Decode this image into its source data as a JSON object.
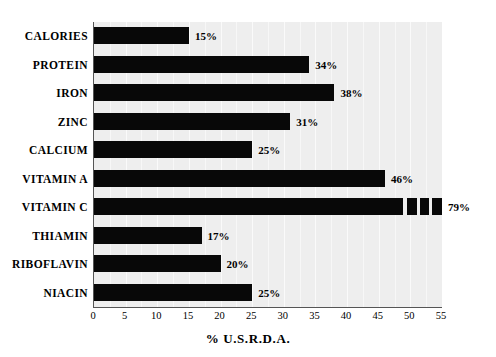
{
  "chart_data": {
    "type": "bar",
    "orientation": "horizontal",
    "title": "",
    "xlabel": "% U.S.R.D.A.",
    "ylabel": "",
    "xlim": [
      0,
      55
    ],
    "xticks": [
      0,
      5,
      10,
      15,
      20,
      25,
      30,
      35,
      40,
      45,
      50,
      55
    ],
    "grid": true,
    "legend": null,
    "categories": [
      "CALORIES",
      "PROTEIN",
      "IRON",
      "ZINC",
      "CALCIUM",
      "VITAMIN A",
      "VITAMIN C",
      "THIAMIN",
      "RIBOFLAVIN",
      "NIACIN"
    ],
    "values": [
      15,
      34,
      38,
      31,
      25,
      46,
      79,
      17,
      20,
      25
    ],
    "data_labels": [
      "15%",
      "34%",
      "38%",
      "31%",
      "25%",
      "46%",
      "79%",
      "17%",
      "20%",
      "25%"
    ],
    "bar_color": "#080808",
    "plot_background": "#eeeeee",
    "axis_color": "#555555"
  },
  "axis": {
    "x_title": "% U.S.R.D.A.",
    "tick_labels": [
      "0",
      "5",
      "10",
      "15",
      "20",
      "25",
      "30",
      "35",
      "40",
      "45",
      "50",
      "55"
    ]
  },
  "rows": [
    {
      "label": "CALORIES",
      "value": 15,
      "data_label": "15%",
      "broken": false
    },
    {
      "label": "PROTEIN",
      "value": 34,
      "data_label": "34%",
      "broken": false
    },
    {
      "label": "IRON",
      "value": 38,
      "data_label": "38%",
      "broken": false
    },
    {
      "label": "ZINC",
      "value": 31,
      "data_label": "31%",
      "broken": false
    },
    {
      "label": "CALCIUM",
      "value": 25,
      "data_label": "25%",
      "broken": false
    },
    {
      "label": "VITAMIN A",
      "value": 46,
      "data_label": "46%",
      "broken": false
    },
    {
      "label": "VITAMIN C",
      "value": 79,
      "data_label": "79%",
      "broken": true
    },
    {
      "label": "THIAMIN",
      "value": 17,
      "data_label": "17%",
      "broken": false
    },
    {
      "label": "RIBOFLAVIN",
      "value": 20,
      "data_label": "20%",
      "broken": false
    },
    {
      "label": "NIACIN",
      "value": 25,
      "data_label": "25%",
      "broken": false
    }
  ]
}
